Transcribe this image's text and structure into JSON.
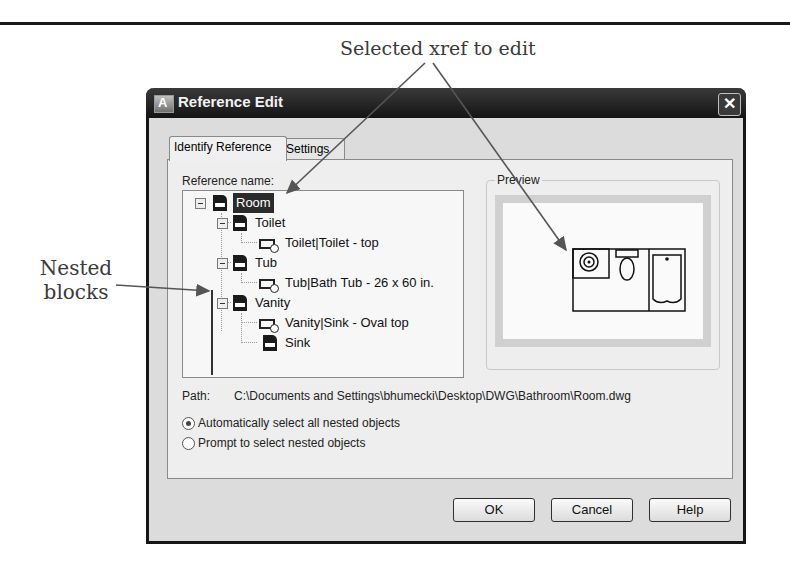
{
  "callouts": {
    "top": "Selected xref to edit",
    "left_line1": "Nested",
    "left_line2": "blocks"
  },
  "dialog": {
    "title": "Reference Edit",
    "close_label": "✕",
    "tabs": [
      {
        "label": "Identify Reference",
        "active": true
      },
      {
        "label": "Settings",
        "active": false
      }
    ],
    "reference_name_label": "Reference name:",
    "tree": [
      {
        "label": "Room",
        "icon": "dwg-icon",
        "level": 0,
        "selected": true
      },
      {
        "label": "Toilet",
        "icon": "dwg-icon",
        "level": 1
      },
      {
        "label": "Toilet|Toilet - top",
        "icon": "block-icon",
        "level": 2
      },
      {
        "label": "Tub",
        "icon": "dwg-icon",
        "level": 1
      },
      {
        "label": "Tub|Bath Tub - 26 x 60 in.",
        "icon": "block-icon",
        "level": 2
      },
      {
        "label": "Vanity",
        "icon": "dwg-icon",
        "level": 1
      },
      {
        "label": "Vanity|Sink - Oval top",
        "icon": "block-icon",
        "level": 2
      },
      {
        "label": "Sink",
        "icon": "dwg-icon",
        "level": 2
      }
    ],
    "preview_label": "Preview",
    "path_label": "Path:",
    "path_value": "C:\\Documents and Settings\\bhumecki\\Desktop\\DWG\\Bathroom\\Room.dwg",
    "radios": [
      {
        "label": "Automatically select all nested objects",
        "checked": true
      },
      {
        "label": "Prompt to select nested objects",
        "checked": false
      }
    ],
    "buttons": {
      "ok": "OK",
      "cancel": "Cancel",
      "help": "Help"
    }
  }
}
